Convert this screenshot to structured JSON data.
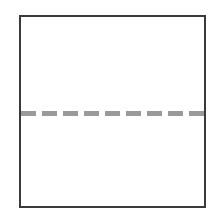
{
  "diagram": {
    "shape": "square",
    "frame": {
      "border_color": "#3a3a3a",
      "fill_color": "#ffffff"
    },
    "divider": {
      "style": "dashed",
      "orientation": "horizontal",
      "color": "#9a9a9a",
      "dash_count": 9,
      "dashes": [
        1,
        2,
        3,
        4,
        5,
        6,
        7,
        8,
        9
      ]
    }
  }
}
